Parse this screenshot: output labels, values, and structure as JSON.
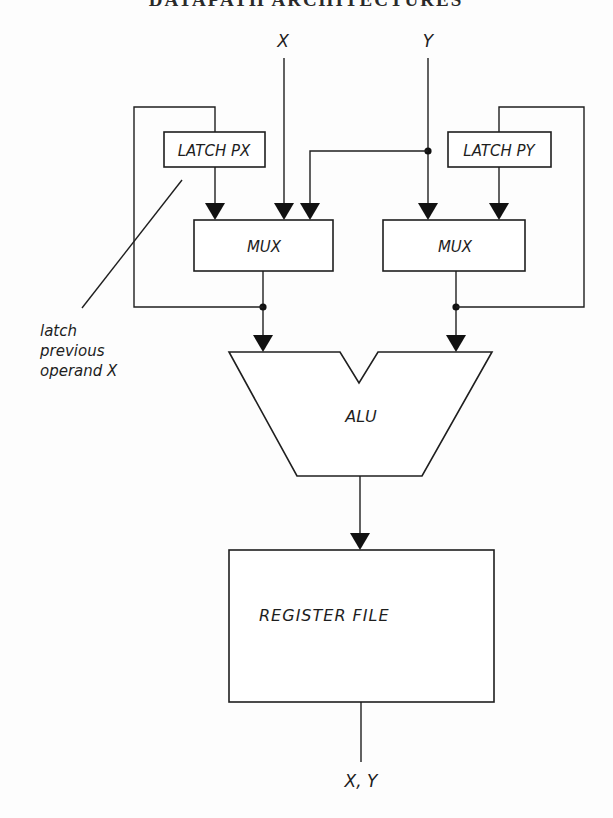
{
  "header": {
    "running_title": "DATAPATH ARCHITECTURES"
  },
  "inputs": {
    "x_label": "X",
    "y_label": "Y"
  },
  "blocks": {
    "latch_px": "LATCH PX",
    "latch_py": "LATCH PY",
    "mux_left": "MUX",
    "mux_right": "MUX",
    "alu": "ALU",
    "register_file": "REGISTER FILE"
  },
  "annotation": {
    "line1": "latch",
    "line2": "previous",
    "line3": "operand X"
  },
  "output": {
    "label": "X, Y"
  },
  "colors": {
    "ink": "#1f1f1f",
    "paper": "#fdfdfd"
  }
}
